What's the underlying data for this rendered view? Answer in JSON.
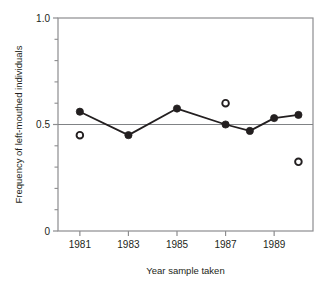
{
  "chart_data": {
    "type": "line",
    "title": "",
    "subtitle": "",
    "xlabel": "Year sample taken",
    "ylabel": "Frequency of left-mouthed individuals",
    "xlim": [
      1980.1,
      1990.6
    ],
    "ylim": [
      0,
      1.0
    ],
    "grid": false,
    "legend_position": "none",
    "x_tick_labels": [
      "1981",
      "1983",
      "1985",
      "1987",
      "1989"
    ],
    "x_tick_values": [
      1981,
      1983,
      1985,
      1987,
      1989
    ],
    "y_tick_labels": [
      "0",
      "0.5",
      "1.0"
    ],
    "y_tick_values": [
      0,
      0.5,
      1.0
    ],
    "y_minor_tick_values": [
      0.1,
      0.2,
      0.3,
      0.4,
      0.6,
      0.7,
      0.8,
      0.9
    ],
    "reference_line": {
      "y": 0.5,
      "label": "",
      "color": "#808285"
    },
    "series": [
      {
        "name": "filled-series",
        "marker": "filled-circle",
        "connected": true,
        "color": "#231f20",
        "x": [
          1981,
          1983,
          1985,
          1987,
          1988,
          1989,
          1990
        ],
        "values": [
          0.56,
          0.45,
          0.575,
          0.5,
          0.47,
          0.53,
          0.545
        ]
      },
      {
        "name": "open-series",
        "marker": "open-circle",
        "connected": false,
        "color": "#231f20",
        "x": [
          1981,
          1987,
          1990
        ],
        "values": [
          0.45,
          0.6,
          0.325
        ]
      }
    ]
  },
  "figure": {
    "plot_box": {
      "left": 58,
      "top": 18,
      "right": 313,
      "bottom": 231
    },
    "axis_color": "#8d8d8f",
    "marker_color": "#231f20"
  }
}
